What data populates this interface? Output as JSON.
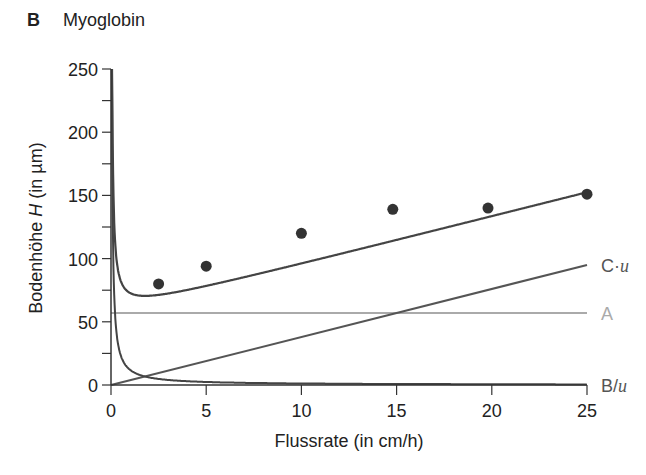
{
  "panel": {
    "letter": "B",
    "title": "Myoglobin"
  },
  "chart_data": {
    "type": "line",
    "title": "Myoglobin",
    "xlabel": "Flussrate (in cm/h)",
    "ylabel_prefix": "Bodenhöhe ",
    "ylabel_var": "H",
    "ylabel_suffix": " (in µm)",
    "xlim": [
      0,
      25
    ],
    "ylim": [
      0,
      250
    ],
    "xticks": [
      0,
      5,
      10,
      15,
      20,
      25
    ],
    "yticks": [
      0,
      50,
      100,
      150,
      200,
      250
    ],
    "y_minor_ticks": [
      25,
      75,
      125,
      175,
      225
    ],
    "grid": false,
    "model": {
      "A": 57,
      "B": 12,
      "C": 3.8,
      "equation": "H = A + B/u + C·u"
    },
    "series": [
      {
        "name": "H (A + B/u + C·u)",
        "kind": "curve",
        "color": "#444444"
      },
      {
        "name": "C·u",
        "kind": "line",
        "color": "#555555",
        "points": [
          [
            0,
            0
          ],
          [
            25,
            95
          ]
        ]
      },
      {
        "name": "A",
        "kind": "hline",
        "color": "#aaaaaa",
        "value": 57
      },
      {
        "name": "B/u",
        "kind": "curve",
        "color": "#444444"
      },
      {
        "name": "Messwerte",
        "kind": "scatter",
        "color": "#333333",
        "points": [
          [
            2.5,
            80
          ],
          [
            5,
            94
          ],
          [
            10,
            120
          ],
          [
            14.8,
            139
          ],
          [
            19.8,
            140
          ],
          [
            25,
            151
          ]
        ]
      }
    ],
    "curve_labels": [
      {
        "text": "C·u",
        "var": "u",
        "prefix": "C·",
        "y": 95,
        "color": "#555555"
      },
      {
        "text": "A",
        "y": 57,
        "color": "#aaaaaa"
      },
      {
        "text": "B/u",
        "var": "u",
        "prefix": "B/",
        "y": 0,
        "color": "#555555"
      }
    ]
  }
}
